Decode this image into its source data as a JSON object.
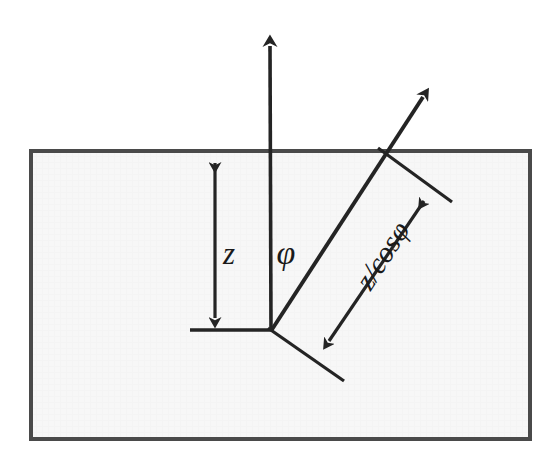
{
  "figure": {
    "type": "geometry-diagram",
    "background_color": "#ffffff",
    "ink_color": "#242424"
  },
  "slab": {
    "name": "medium-rectangle",
    "fill_color": "#f7f7f7",
    "border_color": "#4a4a4a",
    "x": 31,
    "y": 151,
    "width": 499,
    "height": 288
  },
  "labels": {
    "depth": "z",
    "angle": "φ",
    "path_length": "z/cosφ"
  },
  "geometry": {
    "origin": {
      "x": 271,
      "y": 330
    },
    "surface_y": 151,
    "vertical_arrow": {
      "name": "normal-axis-arrow",
      "from": {
        "x": 271,
        "y": 330
      },
      "to": {
        "x": 270,
        "y": 33
      }
    },
    "oblique_arrow": {
      "name": "oblique-ray-arrow",
      "from": {
        "x": 271,
        "y": 330
      },
      "to": {
        "x": 430,
        "y": 86
      },
      "surface_crossing": {
        "x": 383,
        "y": 152
      }
    },
    "baseline": {
      "name": "baseline-segment",
      "from": {
        "x": 190,
        "y": 330
      },
      "to": {
        "x": 272,
        "y": 330
      }
    },
    "depth_dimension": {
      "name": "depth-dimension-arrow",
      "from": {
        "x": 215,
        "y": 152
      },
      "to": {
        "x": 215,
        "y": 329
      }
    },
    "path_dimension": {
      "name": "path-dimension-arrow",
      "from": {
        "x": 432,
        "y": 190
      },
      "to": {
        "x": 320,
        "y": 353
      }
    },
    "extension_tick_upper": {
      "name": "extension-tick-upper",
      "from": {
        "x": 381,
        "y": 150
      },
      "to": {
        "x": 452,
        "y": 202
      }
    },
    "extension_tick_lower": {
      "name": "extension-tick-lower",
      "from": {
        "x": 269,
        "y": 329
      },
      "to": {
        "x": 343,
        "y": 379
      }
    }
  },
  "label_positions": {
    "depth": {
      "x": 229,
      "y": 257
    },
    "angle": {
      "x": 285,
      "y": 255
    },
    "path_length": {
      "x": 385,
      "y": 257,
      "rotation": -57
    }
  },
  "annotations": {
    "depth_meaning": "perpendicular depth below the surface",
    "angle_meaning": "angle between normal and oblique ray",
    "path_meaning": "slant path length along the oblique ray"
  }
}
